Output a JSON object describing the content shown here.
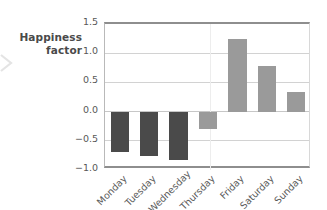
{
  "axis_title": {
    "line1": "Happiness",
    "line2": "factor"
  },
  "decorations": {
    "left_chevron": "chevron-right-icon"
  },
  "chart_data": {
    "type": "bar",
    "title": "",
    "subtitle": "",
    "xlabel": "",
    "ylabel": "Happiness factor",
    "categories": [
      "Monday",
      "Tuesday",
      "Wednesday",
      "Thursday",
      "Friday",
      "Saturday",
      "Sunday"
    ],
    "values": [
      -0.69,
      -0.76,
      -0.83,
      -0.29,
      1.24,
      0.78,
      0.33
    ],
    "bar_colors": [
      "#4a4a4a",
      "#4a4a4a",
      "#4a4a4a",
      "#9a9a9a",
      "#9a9a9a",
      "#9a9a9a",
      "#9a9a9a"
    ],
    "ylim": [
      -1.0,
      1.5
    ],
    "yticks": [
      1.5,
      1.0,
      0.5,
      0.0,
      -0.5,
      -1.0
    ],
    "ytick_labels": [
      "1.5",
      "1.0",
      "0.5",
      "0.0",
      "−0.5",
      "−1.0"
    ],
    "grid": true,
    "grid_axis": "y",
    "legend": false,
    "legend_position": "none",
    "xtick_rotation": -45,
    "colors": {
      "negative_dark": "#4a4a4a",
      "neutral_gray": "#9a9a9a",
      "gridline": "#d2d2d2",
      "frame": "#8e8e8e",
      "text": "#4f4f4f",
      "background": "#ffffff"
    }
  }
}
